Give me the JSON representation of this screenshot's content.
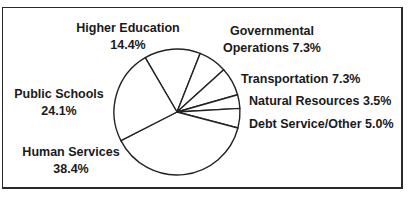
{
  "chart_data": {
    "type": "pie",
    "title": "",
    "categories": [
      "Higher Education",
      "Governmental Operations",
      "Transportation",
      "Natural Resources",
      "Debt Service/Other",
      "Human Services",
      "Public Schools"
    ],
    "values": [
      14.4,
      7.3,
      7.3,
      3.5,
      5.0,
      38.4,
      24.1
    ],
    "unit": "%",
    "start_angle_deg": 239.7,
    "direction": "clockwise",
    "fill": "#ffffff",
    "stroke": "#222222",
    "labels": [
      {
        "line1": "Higher Education",
        "line2": "14.4%"
      },
      {
        "line1": "Governmental",
        "line2": "Operations 7.3%"
      },
      {
        "line1": "Transportation 7.3%"
      },
      {
        "line1": "Natural Resources 3.5%"
      },
      {
        "line1": "Debt Service/Other 5.0%"
      },
      {
        "line1": "Human Services",
        "line2": "38.4%"
      },
      {
        "line1": "Public Schools",
        "line2": "24.1%"
      }
    ]
  }
}
